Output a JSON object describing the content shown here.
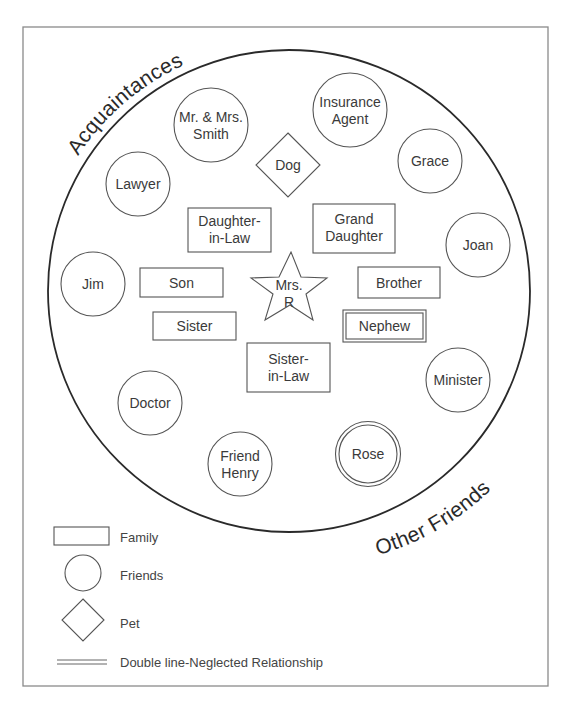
{
  "diagram": {
    "center": {
      "label_line1": "Mrs.",
      "label_line2": "R",
      "shape": "star"
    },
    "arc_labels": {
      "upper_left": "Acquaintances",
      "lower_right": "Other Friends"
    },
    "family": [
      {
        "line1": "Daughter-",
        "line2": "in-Law",
        "double": false
      },
      {
        "line1": "Grand",
        "line2": "Daughter",
        "double": false
      },
      {
        "line1": "Son",
        "double": false
      },
      {
        "line1": "Brother",
        "double": false
      },
      {
        "line1": "Sister",
        "double": false
      },
      {
        "line1": "Nephew",
        "double": true
      },
      {
        "line1": "Sister-",
        "line2": "in-Law",
        "double": false
      }
    ],
    "friends": [
      {
        "line1": "Mr. & Mrs.",
        "line2": "Smith",
        "double": false
      },
      {
        "line1": "Insurance",
        "line2": "Agent",
        "double": false
      },
      {
        "line1": "Lawyer",
        "double": false
      },
      {
        "line1": "Grace",
        "double": false
      },
      {
        "line1": "Jim",
        "double": false
      },
      {
        "line1": "Joan",
        "double": false
      },
      {
        "line1": "Doctor",
        "double": false
      },
      {
        "line1": "Minister",
        "double": false
      },
      {
        "line1": "Friend",
        "line2": "Henry",
        "double": false
      },
      {
        "line1": "Rose",
        "double": true
      }
    ],
    "pets": [
      {
        "line1": "Dog"
      }
    ]
  },
  "legend": {
    "family": "Family",
    "friends": "Friends",
    "pet": "Pet",
    "double_line": "Double line-Neglected Relationship"
  }
}
